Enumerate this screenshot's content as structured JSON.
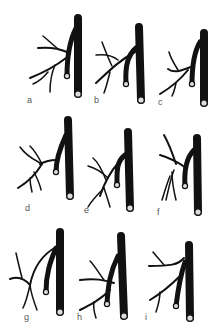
{
  "figure": {
    "panels": [
      {
        "label": "a"
      },
      {
        "label": "b"
      },
      {
        "label": "c"
      },
      {
        "label": "d"
      },
      {
        "label": "e"
      },
      {
        "label": "f"
      },
      {
        "label": "g"
      },
      {
        "label": "h"
      },
      {
        "label": "i"
      }
    ]
  },
  "colors": {
    "vessel": "#111111",
    "background": "#ffffff",
    "label": "#555555"
  }
}
